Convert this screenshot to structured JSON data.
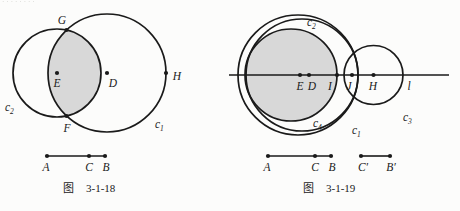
{
  "colors": {
    "ink": "#1a1a1a",
    "shade": "#d8d8d8",
    "paper": "#fcfcfb"
  },
  "artifact_text": "········",
  "fig18": {
    "caption": {
      "prefix": "图",
      "number": "3-1-18"
    },
    "points": {
      "G": "G",
      "F": "F",
      "E": "E",
      "D": "D",
      "H": "H"
    },
    "circles": {
      "c2": {
        "base": "c",
        "sub": "2"
      },
      "c1": {
        "base": "c",
        "sub": "1"
      }
    },
    "segment": {
      "A": "A",
      "C": "C",
      "B": "B"
    }
  },
  "fig19": {
    "caption": {
      "prefix": "图",
      "number": "3-1-19"
    },
    "points": {
      "E": "E",
      "D": "D",
      "I": "I",
      "J": "J",
      "H": "H"
    },
    "line_label": "l",
    "circles": {
      "c2": {
        "base": "c",
        "sub": "2"
      },
      "c1": {
        "base": "c",
        "sub": "1"
      },
      "c3": {
        "base": "c",
        "sub": "3"
      },
      "c4": {
        "base": "c",
        "sub": "4"
      }
    },
    "segment1": {
      "A": "A",
      "C": "C",
      "B": "B"
    },
    "segment2": {
      "Cp": "C′",
      "Bp": "B′"
    }
  }
}
